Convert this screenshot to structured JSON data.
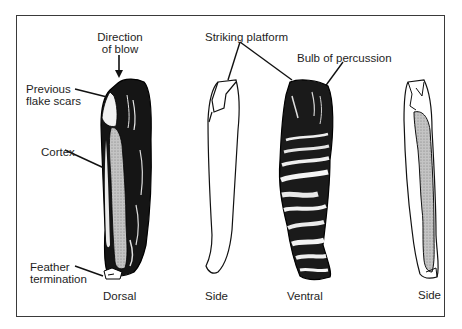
{
  "figure": {
    "views": [
      {
        "id": "dorsal",
        "label": "Dorsal"
      },
      {
        "id": "side-left",
        "label": "Side"
      },
      {
        "id": "ventral",
        "label": "Ventral"
      },
      {
        "id": "side-right",
        "label": "Side"
      }
    ],
    "annotations": {
      "direction_of_blow_line1": "Direction",
      "direction_of_blow_line2": "of blow",
      "previous_flake_scars_line1": "Previous",
      "previous_flake_scars_line2": "flake scars",
      "cortex": "Cortex",
      "feather_termination_line1": "Feather",
      "feather_termination_line2": "termination",
      "striking_platform": "Striking platform",
      "bulb_of_percussion": "Bulb of percussion"
    },
    "colors": {
      "ink": "#111111",
      "cortex_fill": "#b8b8b8",
      "frame": "#3a3a3a",
      "background": "#ffffff"
    }
  }
}
